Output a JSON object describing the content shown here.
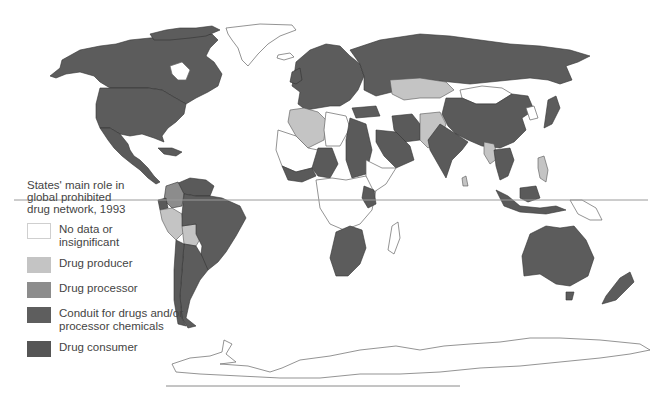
{
  "legend": {
    "title": "States' main role in global prohibited drug network, 1993",
    "title_lines": [
      "States' main role in",
      "global prohibited",
      "drug network, 1993"
    ],
    "items": [
      {
        "label": "No data or insignificant",
        "lines": [
          "No data or",
          "insignificant"
        ],
        "color": "#ffffff",
        "border": "#cfcfcf"
      },
      {
        "label": "Drug producer",
        "lines": [
          "Drug producer"
        ],
        "color": "#c4c4c4"
      },
      {
        "label": "Drug processor",
        "lines": [
          "Drug processor"
        ],
        "color": "#8c8c8c"
      },
      {
        "label": "Conduit for drugs and/or processor chemicals",
        "lines": [
          "Conduit for drugs and/or",
          "processor chemicals"
        ],
        "color": "#5e5e5e"
      },
      {
        "label": "Drug consumer",
        "lines": [
          "Drug consumer"
        ],
        "color": "#555555"
      }
    ]
  },
  "map": {
    "type": "choropleth world map",
    "equator_line": true,
    "regions": {
      "drug_consumer": [
        "United States",
        "Canada",
        "Western Europe",
        "Russia",
        "Australia",
        "New Zealand",
        "Japan",
        "South Africa",
        "Brazil",
        "Argentina"
      ],
      "conduit": [
        "Mexico",
        "Central America",
        "Caribbean",
        "China",
        "India",
        "Iran",
        "Saudi Arabia",
        "Nigeria",
        "Kenya",
        "Southeast Asia",
        "Indonesia",
        "Chile",
        "Venezuela",
        "Egypt",
        "Sudan"
      ],
      "drug_processor": [
        "Colombia"
      ],
      "drug_producer": [
        "Peru",
        "Bolivia",
        "Morocco",
        "Algeria",
        "Kazakhstan",
        "Afghanistan",
        "Pakistan",
        "Myanmar",
        "Laos",
        "Philippines"
      ],
      "no_data": [
        "Greenland",
        "Mongolia",
        "Libya",
        "Mauritania",
        "Mali",
        "Niger",
        "Central Africa",
        "Somalia",
        "Ethiopia",
        "Madagascar",
        "Papua New Guinea",
        "Korea",
        "Antarctica",
        "Angola",
        "Iceland"
      ]
    }
  }
}
